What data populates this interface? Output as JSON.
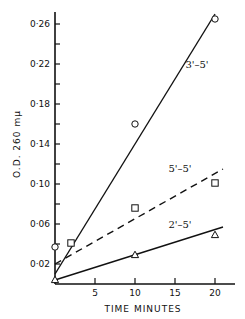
{
  "chart_data": {
    "type": "scatter",
    "title": "",
    "xlabel": "TIME MINUTES",
    "ylabel": "O.D. 260 mμ",
    "xlim": [
      0,
      22
    ],
    "ylim": [
      0,
      0.28
    ],
    "grid": false,
    "legend": "inline labels on lines",
    "x_ticks": [
      5,
      10,
      15,
      20
    ],
    "y_ticks": [
      "0·02",
      "0·06",
      "0·10",
      "0·14",
      "0·18",
      "0·22",
      "0·26"
    ],
    "y_tick_values": [
      0.02,
      0.06,
      0.1,
      0.14,
      0.18,
      0.22,
      0.26
    ],
    "series": [
      {
        "name": "3'–5'",
        "marker": "circle",
        "line": "solid",
        "points": [
          [
            0,
            0.037
          ],
          [
            10,
            0.16
          ],
          [
            20,
            0.265
          ]
        ],
        "fit_line": [
          [
            0,
            0.01
          ],
          [
            20,
            0.27
          ]
        ]
      },
      {
        "name": "5'–5'",
        "marker": "square",
        "line": "dashed",
        "points": [
          [
            2,
            0.041
          ],
          [
            10,
            0.076
          ],
          [
            20,
            0.101
          ]
        ],
        "fit_line": [
          [
            0,
            0.02
          ],
          [
            21,
            0.115
          ]
        ]
      },
      {
        "name": "2'–5'",
        "marker": "triangle",
        "line": "solid",
        "points": [
          [
            0,
            0.004
          ],
          [
            10,
            0.029
          ],
          [
            20,
            0.049
          ]
        ],
        "fit_line": [
          [
            0,
            0.004
          ],
          [
            21,
            0.057
          ]
        ]
      }
    ]
  }
}
